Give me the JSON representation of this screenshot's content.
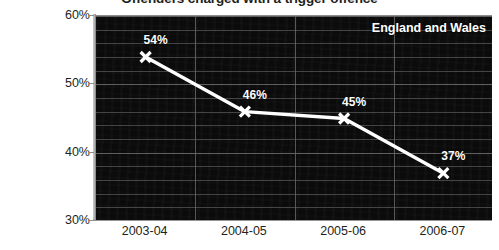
{
  "chart_data": {
    "type": "line",
    "title": "Offenders charged with a trigger offence",
    "xlabel": "",
    "ylabel": "",
    "categories": [
      "2003-04",
      "2004-05",
      "2005-06",
      "2006-07"
    ],
    "values": [
      54,
      46,
      45,
      37
    ],
    "point_labels": [
      "54%",
      "46%",
      "45%",
      "37%"
    ],
    "series": [
      {
        "name": "England and Wales",
        "values": [
          54,
          46,
          45,
          37
        ]
      }
    ],
    "ylim": [
      30,
      60
    ],
    "ytick_labels": [
      "60%",
      "50%",
      "40%",
      "30%"
    ],
    "ytick_values": [
      60,
      50,
      40,
      30
    ],
    "minor_gridline_step": 2,
    "grid": true,
    "legend": "England and Wales",
    "legend_position": "top-right",
    "colors": {
      "plot_background": "#0a0a0a",
      "series_line": "#ffffff",
      "marker": "#ffffff",
      "gridline": "#5a5a5a",
      "axis_text": "#231f20",
      "label_text": "#ffffff",
      "page_background": "#ffffff"
    },
    "marker_style": "x-cross"
  }
}
